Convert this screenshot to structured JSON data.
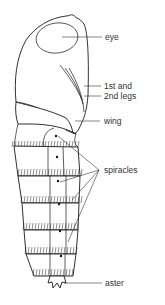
{
  "diagram": {
    "labels": [
      {
        "id": "eye",
        "text": "eye"
      },
      {
        "id": "legs_line1",
        "text": "1st and"
      },
      {
        "id": "legs_line2",
        "text": "2nd legs"
      },
      {
        "id": "wing",
        "text": "wing"
      },
      {
        "id": "spiracles",
        "text": "spiracles"
      },
      {
        "id": "aster",
        "text": "aster"
      }
    ],
    "colors": {
      "ink": "#1a1a1a",
      "label_text": "#333333",
      "background": "#ffffff"
    },
    "segment_count": 6,
    "spiracle_leader_count": 4
  }
}
